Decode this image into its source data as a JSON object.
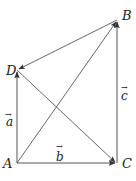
{
  "diagram": {
    "points": {
      "A": {
        "label": "A",
        "x": 17,
        "y": 163
      },
      "B": {
        "label": "B",
        "x": 117,
        "y": 20
      },
      "C": {
        "label": "C",
        "x": 117,
        "y": 163
      },
      "D": {
        "label": "D",
        "x": 17,
        "y": 70
      }
    },
    "vectors": {
      "a": {
        "label": "a",
        "arrow": "→",
        "from": "A",
        "to": "D"
      },
      "b": {
        "label": "b",
        "arrow": "→",
        "from": "A",
        "to": "C"
      },
      "c": {
        "label": "c",
        "arrow": "→",
        "from": "C",
        "to": "B"
      }
    },
    "extra_arrows": [
      {
        "from": "A",
        "to": "B"
      },
      {
        "from": "B",
        "to": "D"
      },
      {
        "from": "D",
        "to": "C"
      }
    ],
    "colors": {
      "line": "#555555",
      "text": "#222222",
      "background": "#ffffff"
    }
  }
}
